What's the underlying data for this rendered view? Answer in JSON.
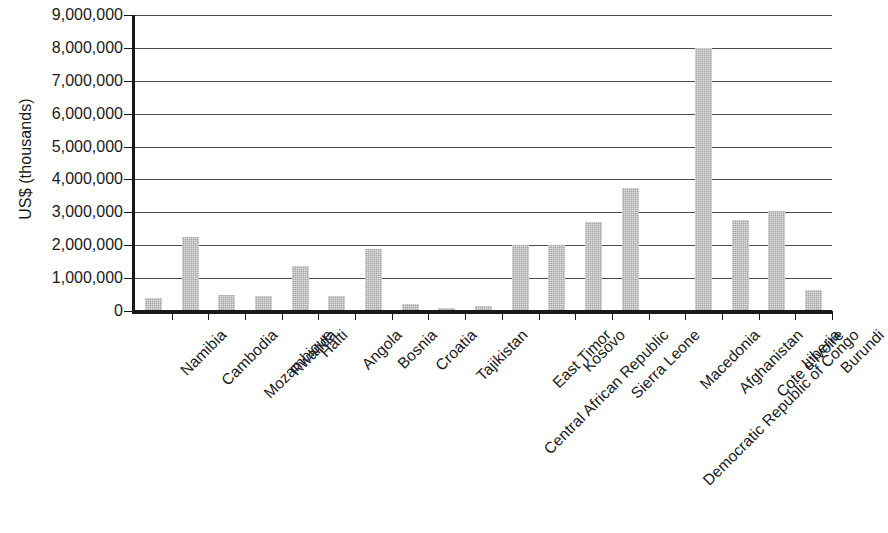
{
  "chart_data": {
    "type": "bar",
    "title": "",
    "subtitle": "",
    "xlabel": "",
    "ylabel": "US$ (thousands)",
    "ylim": [
      0,
      9000000
    ],
    "ytick_step": 1000000,
    "ytick_labels": [
      "0",
      "1,000,000",
      "2,000,000",
      "3,000,000",
      "4,000,000",
      "5,000,000",
      "6,000,000",
      "7,000,000",
      "8,000,000",
      "9,000,000"
    ],
    "ytick_values": [
      0,
      1000000,
      2000000,
      3000000,
      4000000,
      5000000,
      6000000,
      7000000,
      8000000,
      9000000
    ],
    "grid": true,
    "grid_axis": "y",
    "legend": false,
    "legend_position": "none",
    "bar_color": "#a5a5a5",
    "categories": [
      "Namibia",
      "Cambodia",
      "Mozambique",
      "Rwanda",
      "Haiti",
      "Angola",
      "Bosnia",
      "Croatia",
      "Tajikistan",
      "Central African Republic",
      "East Timor",
      "Kosovo",
      "Sierra Leone",
      "Democratic Republic of Congo",
      "Macedonia",
      "Afghanistan",
      "Cote d'Ivoire",
      "Liberia",
      "Burundi"
    ],
    "values": [
      400000,
      2250000,
      500000,
      470000,
      1370000,
      470000,
      1900000,
      200000,
      80000,
      150000,
      2000000,
      2000000,
      2700000,
      3750000,
      20000,
      8000000,
      2780000,
      3050000,
      650000
    ]
  }
}
